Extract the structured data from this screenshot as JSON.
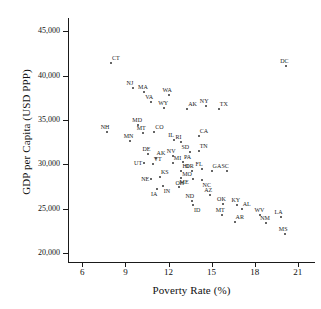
{
  "chart_data": {
    "type": "scatter",
    "title": "",
    "xlabel": "Poverty Rate (%)",
    "ylabel": "GDP per Capita (USD PPP)",
    "xlim": [
      5.0,
      22.2
    ],
    "ylim": [
      19000,
      46500
    ],
    "xticks": [
      6,
      9,
      12,
      15,
      18,
      21
    ],
    "xticklabels": [
      "6",
      "9",
      "12",
      "15",
      "18",
      "21"
    ],
    "yticks": [
      20000,
      25000,
      30000,
      35000,
      40000,
      45000
    ],
    "yticklabels": [
      "20,000",
      "25,000",
      "30,000",
      "35,000",
      "40,000",
      "45,000"
    ],
    "grid": false,
    "legend": null,
    "point_color": "#333333",
    "point_label_field": "label",
    "points": [
      {
        "label": "DC",
        "x": 20.2,
        "y": 41100,
        "pos": "n"
      },
      {
        "label": "CT",
        "x": 8.0,
        "y": 41400,
        "pos": "ne"
      },
      {
        "label": "NJ",
        "x": 9.5,
        "y": 38600,
        "pos": "n"
      },
      {
        "label": "MA",
        "x": 10.3,
        "y": 38200,
        "pos": "n"
      },
      {
        "label": "WA",
        "x": 12.0,
        "y": 37800,
        "pos": "n"
      },
      {
        "label": "VA",
        "x": 10.8,
        "y": 37000,
        "pos": "n"
      },
      {
        "label": "AK",
        "x": 13.3,
        "y": 36200,
        "pos": "ne"
      },
      {
        "label": "WY",
        "x": 11.7,
        "y": 36400,
        "pos": "n"
      },
      {
        "label": "NY",
        "x": 14.6,
        "y": 36600,
        "pos": "n"
      },
      {
        "label": "TX",
        "x": 15.5,
        "y": 36200,
        "pos": "ne"
      },
      {
        "label": "NH",
        "x": 7.7,
        "y": 33700,
        "pos": "n"
      },
      {
        "label": "MD",
        "x": 9.9,
        "y": 34400,
        "pos": "n"
      },
      {
        "label": "MT",
        "x": 10.2,
        "y": 33500,
        "pos": "n"
      },
      {
        "label": "CO",
        "x": 11.0,
        "y": 33600,
        "pos": "ne"
      },
      {
        "label": "MN",
        "x": 9.3,
        "y": 32600,
        "pos": "n"
      },
      {
        "label": "IL",
        "x": 12.4,
        "y": 32700,
        "pos": "n"
      },
      {
        "label": "CA",
        "x": 14.1,
        "y": 33200,
        "pos": "ne"
      },
      {
        "label": "RI",
        "x": 12.9,
        "y": 32500,
        "pos": "n"
      },
      {
        "label": "DE",
        "x": 10.6,
        "y": 31200,
        "pos": "n"
      },
      {
        "label": "NV",
        "x": 12.3,
        "y": 31000,
        "pos": "n"
      },
      {
        "label": "SD",
        "x": 13.5,
        "y": 31400,
        "pos": "nw"
      },
      {
        "label": "TN",
        "x": 14.1,
        "y": 31500,
        "pos": "ne"
      },
      {
        "label": "AK",
        "x": 11.1,
        "y": 30700,
        "pos": "ne"
      },
      {
        "label": "UT",
        "x": 10.3,
        "y": 30200,
        "pos": "w"
      },
      {
        "label": "VT",
        "x": 10.9,
        "y": 30000,
        "pos": "ne"
      },
      {
        "label": "MI",
        "x": 12.3,
        "y": 30200,
        "pos": "ne"
      },
      {
        "label": "PA",
        "x": 13.0,
        "y": 30300,
        "pos": "ne"
      },
      {
        "label": "HI",
        "x": 12.9,
        "y": 29200,
        "pos": "ne"
      },
      {
        "label": "OR",
        "x": 13.6,
        "y": 29200,
        "pos": "n"
      },
      {
        "label": "FL",
        "x": 14.3,
        "y": 29500,
        "pos": "n"
      },
      {
        "label": "GA",
        "x": 15.0,
        "y": 29200,
        "pos": "ne"
      },
      {
        "label": "SC",
        "x": 16.1,
        "y": 29300,
        "pos": "n"
      },
      {
        "label": "KS",
        "x": 11.4,
        "y": 28600,
        "pos": "ne"
      },
      {
        "label": "NE",
        "x": 10.8,
        "y": 28400,
        "pos": "w"
      },
      {
        "label": "OH",
        "x": 12.9,
        "y": 28500,
        "pos": "s"
      },
      {
        "label": "MO",
        "x": 13.7,
        "y": 28400,
        "pos": "nw"
      },
      {
        "label": "NC",
        "x": 14.3,
        "y": 28200,
        "pos": "se"
      },
      {
        "label": "IN",
        "x": 11.6,
        "y": 27600,
        "pos": "se"
      },
      {
        "label": "IA",
        "x": 11.2,
        "y": 27200,
        "pos": "s"
      },
      {
        "label": "ME",
        "x": 12.7,
        "y": 27400,
        "pos": "ne"
      },
      {
        "label": "ND",
        "x": 13.6,
        "y": 25900,
        "pos": "n"
      },
      {
        "label": "ID",
        "x": 13.7,
        "y": 25400,
        "pos": "se"
      },
      {
        "label": "AZ",
        "x": 14.9,
        "y": 26600,
        "pos": "n"
      },
      {
        "label": "OK",
        "x": 15.8,
        "y": 25500,
        "pos": "n"
      },
      {
        "label": "KY",
        "x": 16.8,
        "y": 25400,
        "pos": "n"
      },
      {
        "label": "AL",
        "x": 17.1,
        "y": 25000,
        "pos": "ne"
      },
      {
        "label": "MT",
        "x": 15.7,
        "y": 24300,
        "pos": "n"
      },
      {
        "label": "AR",
        "x": 16.6,
        "y": 23500,
        "pos": "ne"
      },
      {
        "label": "WV",
        "x": 18.4,
        "y": 24300,
        "pos": "n"
      },
      {
        "label": "LA",
        "x": 19.8,
        "y": 24100,
        "pos": "n"
      },
      {
        "label": "NM",
        "x": 18.8,
        "y": 23400,
        "pos": "n"
      },
      {
        "label": "MS",
        "x": 20.1,
        "y": 22200,
        "pos": "n"
      }
    ]
  }
}
